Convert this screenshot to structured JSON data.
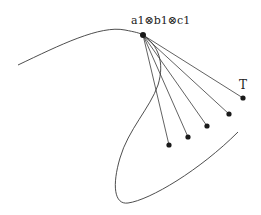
{
  "diagram": {
    "labels": {
      "apex": "a1⊗b1⊗c1",
      "endpoint": "T"
    },
    "apex_point": {
      "x": 143,
      "y": 35
    },
    "endpoints": [
      {
        "x": 169,
        "y": 145
      },
      {
        "x": 188,
        "y": 137
      },
      {
        "x": 207,
        "y": 126
      },
      {
        "x": 229,
        "y": 114
      },
      {
        "x": 243,
        "y": 98
      }
    ],
    "colors": {
      "line": "#3a3a3a",
      "node": "#1a1a1a",
      "text": "#222222",
      "background": "#ffffff"
    }
  }
}
